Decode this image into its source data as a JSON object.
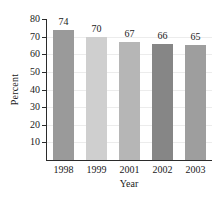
{
  "chart_data": {
    "type": "bar",
    "title": "",
    "xlabel": "Year",
    "ylabel": "Percent",
    "categories": [
      "1998",
      "1999",
      "2001",
      "2002",
      "2003"
    ],
    "values": [
      74,
      70,
      67,
      66,
      65
    ],
    "value_labels": [
      "74",
      "70",
      "67",
      "66",
      "65"
    ],
    "ylim": [
      0,
      80
    ],
    "ytick_labels": [
      "10",
      "20",
      "30",
      "40",
      "50",
      "60",
      "70",
      "80"
    ],
    "yticks": [
      10,
      20,
      30,
      40,
      50,
      60,
      70,
      80
    ],
    "grid": true,
    "legend": "none",
    "bar_colors": [
      "#9a9a9a",
      "#cfcfcf",
      "#b6b6b6",
      "#868686",
      "#9e9e9e"
    ],
    "axis_color": "#2b2b2b",
    "grid_color": "#ececec",
    "background": "#ffffff"
  }
}
